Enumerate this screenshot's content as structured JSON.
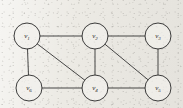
{
  "figure": {
    "kind": "undirected-graph-diagram",
    "background_color": "#eceae4",
    "ink_color": "#2b2b2b",
    "node_fill_color": "#f3f2ee",
    "node_radius": 13,
    "width": 183,
    "height": 108
  },
  "graph": {
    "vertex_count": 6,
    "edge_count": 9,
    "vertices": [
      {
        "id": "v1",
        "label": "v",
        "subscript": "1",
        "x": 27,
        "y": 36
      },
      {
        "id": "v2",
        "label": "v",
        "subscript": "2",
        "x": 95,
        "y": 36
      },
      {
        "id": "v3",
        "label": "v",
        "subscript": "3",
        "x": 158,
        "y": 36
      },
      {
        "id": "v4",
        "label": "v",
        "subscript": "4",
        "x": 95,
        "y": 88
      },
      {
        "id": "v5",
        "label": "v",
        "subscript": "5",
        "x": 158,
        "y": 88
      },
      {
        "id": "v6",
        "label": "v",
        "subscript": "6",
        "x": 29,
        "y": 88
      }
    ],
    "edges": [
      {
        "id": "e1",
        "from": "v1",
        "to": "v2",
        "name": "edge-v1-v2"
      },
      {
        "id": "e2",
        "from": "v2",
        "to": "v3",
        "name": "edge-v2-v3"
      },
      {
        "id": "e3",
        "from": "v1",
        "to": "v6",
        "name": "edge-v1-v6"
      },
      {
        "id": "e4",
        "from": "v1",
        "to": "v4",
        "name": "edge-v1-v4"
      },
      {
        "id": "e5",
        "from": "v2",
        "to": "v4",
        "name": "edge-v2-v4"
      },
      {
        "id": "e6",
        "from": "v2",
        "to": "v5",
        "name": "edge-v2-v5"
      },
      {
        "id": "e7",
        "from": "v3",
        "to": "v5",
        "name": "edge-v3-v5"
      },
      {
        "id": "e8",
        "from": "v6",
        "to": "v4",
        "name": "edge-v6-v4"
      },
      {
        "id": "e9",
        "from": "v4",
        "to": "v5",
        "name": "edge-v4-v5"
      }
    ]
  }
}
